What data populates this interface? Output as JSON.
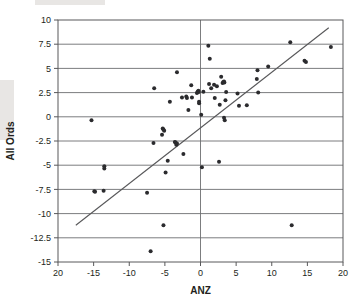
{
  "chart_data": {
    "type": "scatter",
    "title": "",
    "xlabel": "ANZ",
    "ylabel": "All Ords",
    "xlim": [
      -20,
      20
    ],
    "ylim": [
      -15,
      10
    ],
    "grid": true,
    "legend": null,
    "x_ticks": [
      -20,
      -15,
      -10,
      -5,
      0,
      5,
      10,
      15,
      20
    ],
    "x_tick_labels": [
      "20",
      "-15",
      "-10",
      "-5",
      "0",
      "5",
      "10",
      "15",
      "20"
    ],
    "y_ticks": [
      10,
      7.5,
      5,
      2.5,
      0,
      -2.5,
      -5,
      -7.5,
      -10,
      -12.5,
      -15
    ],
    "y_tick_labels": [
      "10",
      "7.5",
      "5",
      "2.5",
      "0",
      "-2.5",
      "-5",
      "-7.5",
      "-10",
      "-12.5",
      "-15"
    ],
    "gridlines_y": [
      10,
      7.5,
      5,
      2.5,
      0,
      -2.5,
      -5,
      -7.5,
      -10,
      -12.5,
      -15
    ],
    "gridlines_x": [
      0
    ],
    "marker": "dot",
    "marker_size": 2.0,
    "series": [
      {
        "name": "ANZ vs All Ords",
        "points": [
          [
            -15.3,
            -0.35
          ],
          [
            -14.9,
            -7.7
          ],
          [
            -14.8,
            -7.75
          ],
          [
            -13.6,
            -7.65
          ],
          [
            -13.5,
            -5.1
          ],
          [
            -13.5,
            -5.35
          ],
          [
            -7.5,
            -7.85
          ],
          [
            -7.0,
            -13.9
          ],
          [
            -6.6,
            -2.7
          ],
          [
            -6.5,
            2.95
          ],
          [
            -5.4,
            -1.85
          ],
          [
            -5.3,
            -1.2
          ],
          [
            -5.2,
            -1.3
          ],
          [
            -5.2,
            -11.2
          ],
          [
            -5.1,
            -1.45
          ],
          [
            -4.9,
            -5.75
          ],
          [
            -4.6,
            -4.55
          ],
          [
            -4.3,
            1.55
          ],
          [
            -3.6,
            -2.6
          ],
          [
            -3.5,
            -2.65
          ],
          [
            -3.4,
            -2.9
          ],
          [
            -3.3,
            4.6
          ],
          [
            -3.3,
            -2.75
          ],
          [
            -2.6,
            2.0
          ],
          [
            -2.4,
            -3.85
          ],
          [
            -2.0,
            2.1
          ],
          [
            -1.9,
            1.95
          ],
          [
            -1.7,
            0.7
          ],
          [
            -1.3,
            3.25
          ],
          [
            -1.2,
            2.0
          ],
          [
            -0.5,
            2.45
          ],
          [
            -0.4,
            2.6
          ],
          [
            -0.3,
            2.7
          ],
          [
            -0.25,
            2.55
          ],
          [
            -0.2,
            1.4
          ],
          [
            -0.2,
            1.55
          ],
          [
            0.1,
            0.2
          ],
          [
            0.2,
            -5.2
          ],
          [
            0.4,
            2.6
          ],
          [
            1.1,
            7.35
          ],
          [
            1.2,
            3.4
          ],
          [
            1.3,
            6.0
          ],
          [
            1.5,
            2.95
          ],
          [
            1.9,
            3.3
          ],
          [
            2.0,
            1.95
          ],
          [
            2.3,
            3.15
          ],
          [
            2.6,
            -4.65
          ],
          [
            2.7,
            1.25
          ],
          [
            2.9,
            4.15
          ],
          [
            3.1,
            3.5
          ],
          [
            3.2,
            3.6
          ],
          [
            3.3,
            3.65
          ],
          [
            3.3,
            -0.1
          ],
          [
            3.35,
            3.55
          ],
          [
            3.4,
            -0.35
          ],
          [
            3.5,
            1.7
          ],
          [
            3.6,
            2.55
          ],
          [
            5.2,
            2.4
          ],
          [
            5.4,
            1.15
          ],
          [
            6.5,
            1.2
          ],
          [
            7.9,
            3.9
          ],
          [
            8.0,
            4.8
          ],
          [
            8.1,
            2.5
          ],
          [
            9.5,
            5.2
          ],
          [
            12.6,
            7.7
          ],
          [
            12.8,
            -11.2
          ],
          [
            14.6,
            5.8
          ],
          [
            14.8,
            5.65
          ],
          [
            18.3,
            7.2
          ]
        ]
      }
    ],
    "fit_line": {
      "name": "linear-trend",
      "x_start": -17.5,
      "y_start": -11.2,
      "x_end": 18.0,
      "y_end": 9.2
    }
  }
}
